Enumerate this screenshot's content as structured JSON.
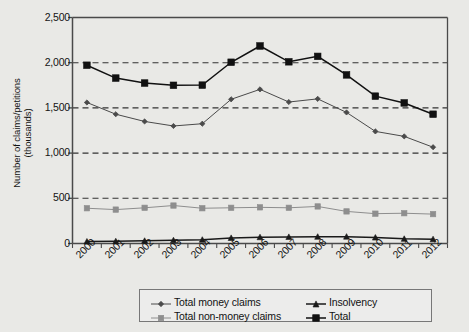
{
  "chart_data": {
    "type": "line",
    "title": "",
    "xlabel": "",
    "ylabel": "Number of claims/petitions (thousands)",
    "ylabel_line1": "Number of claims/petitions",
    "ylabel_line2": "(thousands)",
    "categories": [
      "2000",
      "2001",
      "2002",
      "2003",
      "2004",
      "2005",
      "2006",
      "2007",
      "2008",
      "2009",
      "2010",
      "2011",
      "2012"
    ],
    "ylim": [
      0,
      2500
    ],
    "yticks": [
      0,
      500,
      1000,
      1500,
      2000,
      2500
    ],
    "ytick_labels": [
      "0",
      "500",
      "1,000",
      "1,500",
      "2,000",
      "2,500"
    ],
    "grid": "horizontal-dashed",
    "legend_position": "below-chart",
    "series": [
      {
        "name": "Total money claims",
        "marker": "diamond",
        "color": "#4a4a4a",
        "values": [
          1560,
          1430,
          1350,
          1300,
          1325,
          1595,
          1705,
          1565,
          1600,
          1450,
          1240,
          1185,
          1065
        ]
      },
      {
        "name": "Total non-money claims",
        "marker": "square",
        "color": "#8e8e8e",
        "values": [
          390,
          375,
          395,
          420,
          390,
          395,
          400,
          395,
          410,
          355,
          330,
          335,
          325
        ]
      },
      {
        "name": "Insolvency",
        "marker": "triangle",
        "color": "#1a1a1a",
        "values": [
          22,
          25,
          30,
          36,
          42,
          62,
          70,
          73,
          75,
          76,
          66,
          52,
          48
        ]
      },
      {
        "name": "Total",
        "marker": "square-filled",
        "color": "#111111",
        "values": [
          1972,
          1830,
          1775,
          1750,
          1752,
          2005,
          2185,
          2010,
          2070,
          1865,
          1630,
          1555,
          1430
        ]
      }
    ]
  },
  "legend": {
    "items": [
      {
        "label": "Total money claims",
        "marker": "diamond"
      },
      {
        "label": "Total non-money claims",
        "marker": "square"
      },
      {
        "label": "Insolvency",
        "marker": "triangle"
      },
      {
        "label": "Total",
        "marker": "square-filled"
      }
    ]
  },
  "colors": {
    "background": "#e9e9e6",
    "plot_background": "#e9e9e6",
    "axis": "#4a4a4a",
    "gridline": "#333333",
    "text": "#141414"
  }
}
